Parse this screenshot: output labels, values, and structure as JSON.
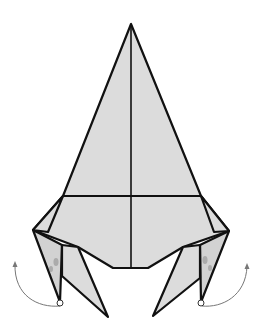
{
  "diagram": {
    "title": "",
    "colors": {
      "paper": "#dcdcdc",
      "outline": "#111111",
      "arrow": "#777777",
      "background": "#ffffff"
    },
    "elements": [
      {
        "name": "main-kite-body",
        "type": "polygon"
      },
      {
        "name": "vertical-center-crease",
        "type": "line"
      },
      {
        "name": "horizontal-crease",
        "type": "line"
      },
      {
        "name": "left-leg-flap",
        "type": "polygon"
      },
      {
        "name": "right-leg-flap",
        "type": "polygon"
      },
      {
        "name": "left-fold-arrow",
        "type": "curved-arrow",
        "direction": "up-left"
      },
      {
        "name": "right-fold-arrow",
        "type": "curved-arrow",
        "direction": "up-right"
      }
    ]
  }
}
